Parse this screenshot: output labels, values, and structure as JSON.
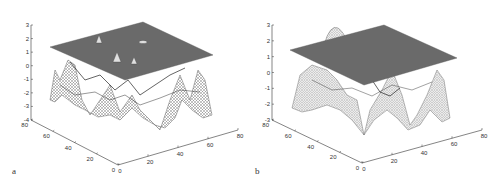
{
  "chart_data": [
    {
      "type": "surface3d",
      "panel_label": "a",
      "title": "",
      "zlabel": "",
      "xlabel": "",
      "ylabel": "",
      "z_ticks": [
        "3",
        "2",
        "1",
        "0",
        "-1",
        "-2",
        "-3",
        "-4"
      ],
      "zlim": [
        -4,
        3
      ],
      "y_ticks": [
        "80",
        "60",
        "40",
        "20",
        "0"
      ],
      "x_ticks": [
        "0",
        "20",
        "40",
        "60",
        "80"
      ],
      "xlim": [
        0,
        80
      ],
      "ylim": [
        0,
        80
      ],
      "plane_z": 1.3,
      "description": "Wireframe oscillating surface mostly below a flat grey plane near z≈1.3; several small peaks poke through the plane.",
      "peaks_through_plane": 4
    },
    {
      "type": "surface3d",
      "panel_label": "b",
      "title": "",
      "zlabel": "",
      "xlabel": "",
      "ylabel": "",
      "z_ticks": [
        "3",
        "2",
        "1",
        "0",
        "-1",
        "-2",
        "-3"
      ],
      "zlim": [
        -3,
        3
      ],
      "y_ticks": [
        "80",
        "60",
        "40",
        "20",
        "0"
      ],
      "x_ticks": [
        "0",
        "20",
        "40",
        "60",
        "80"
      ],
      "xlim": [
        0,
        80
      ],
      "ylim": [
        0,
        80
      ],
      "plane_z": 1.3,
      "description": "Smoother wireframe surface with broad valleys below a flat grey plane near z≈1.3; one peak rises through the plane at the back.",
      "peaks_through_plane": 1
    }
  ],
  "labels": {
    "a": "a",
    "b": "b"
  }
}
